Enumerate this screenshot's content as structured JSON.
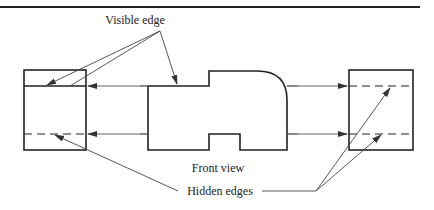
{
  "diagram": {
    "labels": {
      "visible_edge": "Visible edge",
      "front_view": "Front view",
      "hidden_edges": "Hidden edges"
    },
    "colors": {
      "stroke": "#222222",
      "projection_line": "#555555",
      "background": "#ffffff"
    },
    "views": [
      {
        "name": "left-side-view",
        "x": 24,
        "y": 70,
        "width": 62,
        "height": 80
      },
      {
        "name": "front-view",
        "x": 148,
        "y": 71,
        "width": 139,
        "height": 79
      },
      {
        "name": "right-side-view",
        "x": 349,
        "y": 70,
        "width": 64,
        "height": 80
      }
    ],
    "projection_lines_y": [
      86,
      134
    ]
  }
}
